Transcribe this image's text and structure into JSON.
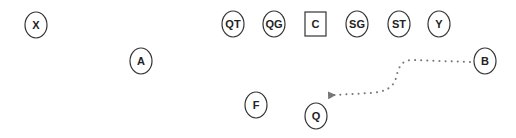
{
  "diagram": {
    "type": "football-formation",
    "colors": {
      "stroke": "#333333",
      "text": "#222222",
      "route": "#777777",
      "background": "#ffffff"
    },
    "players": [
      {
        "id": "X",
        "label": "X",
        "shape": "ellipse",
        "cx": 36,
        "cy": 25
      },
      {
        "id": "QT",
        "label": "QT",
        "shape": "ellipse",
        "cx": 233,
        "cy": 24
      },
      {
        "id": "QG",
        "label": "QG",
        "shape": "ellipse",
        "cx": 274,
        "cy": 24
      },
      {
        "id": "C",
        "label": "C",
        "shape": "square",
        "cx": 315,
        "cy": 24
      },
      {
        "id": "SG",
        "label": "SG",
        "shape": "ellipse",
        "cx": 357,
        "cy": 24
      },
      {
        "id": "ST",
        "label": "ST",
        "shape": "ellipse",
        "cx": 399,
        "cy": 24
      },
      {
        "id": "Y",
        "label": "Y",
        "shape": "ellipse",
        "cx": 439,
        "cy": 24
      },
      {
        "id": "A",
        "label": "A",
        "shape": "ellipse",
        "cx": 141,
        "cy": 61
      },
      {
        "id": "B",
        "label": "B",
        "shape": "ellipse",
        "cx": 485,
        "cy": 61
      },
      {
        "id": "F",
        "label": "F",
        "shape": "ellipse",
        "cx": 256,
        "cy": 105
      },
      {
        "id": "Q",
        "label": "Q",
        "shape": "ellipse",
        "cx": 316,
        "cy": 116
      }
    ],
    "routes": [
      {
        "from": "B",
        "style": "dotted",
        "arrow": true,
        "path": "M 470 62 L 412 60 C 400 60 398 70 396 78 C 393 88 385 92 370 93 L 334 95"
      }
    ]
  }
}
